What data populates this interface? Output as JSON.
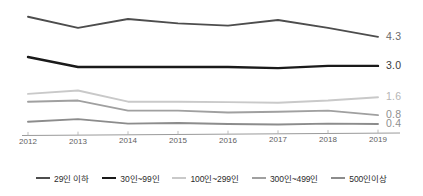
{
  "chart_data": {
    "type": "line",
    "title": "",
    "subtitle": "",
    "xlabel": "",
    "ylabel": "",
    "x": [
      "2012",
      "2013",
      "2014",
      "2015",
      "2016",
      "2017",
      "2018",
      "2019"
    ],
    "categories": [
      "2012",
      "2013",
      "2014",
      "2015",
      "2016",
      "2017",
      "2018",
      "2019"
    ],
    "xlim": [
      2012,
      2019
    ],
    "ylim": [
      0,
      5.5
    ],
    "grid": false,
    "legend_position": "bottom",
    "series": [
      {
        "name": "29인 이하",
        "color": "#4d4d4d",
        "width": 1.9,
        "values": [
          5.2,
          4.7,
          5.1,
          4.9,
          4.8,
          5.05,
          4.7,
          4.3
        ],
        "end_label": "4.3"
      },
      {
        "name": "30인~99인",
        "color": "#1a1a1a",
        "width": 2.4,
        "values": [
          3.4,
          2.95,
          2.95,
          2.95,
          2.95,
          2.9,
          3.0,
          3.0
        ],
        "end_label": "3.0"
      },
      {
        "name": "100인~299인",
        "color": "#c9c9c9",
        "width": 1.9,
        "values": [
          1.75,
          1.9,
          1.4,
          1.4,
          1.38,
          1.35,
          1.45,
          1.6
        ],
        "end_label": "1.6"
      },
      {
        "name": "300인~499인",
        "color": "#a0a0a0",
        "width": 1.9,
        "values": [
          1.4,
          1.45,
          1.0,
          1.0,
          0.92,
          0.95,
          1.0,
          0.8
        ],
        "end_label": "0.8"
      },
      {
        "name": "500인이상",
        "color": "#8c8c8c",
        "width": 1.9,
        "values": [
          0.5,
          0.62,
          0.42,
          0.45,
          0.4,
          0.38,
          0.42,
          0.4
        ],
        "end_label": "0.4"
      }
    ],
    "value_labels": [
      {
        "text": "4.3",
        "color": "#6a6a6a"
      },
      {
        "text": "3.0",
        "color": "#3a3a3a"
      },
      {
        "text": "1.6",
        "color": "#b5b5b5"
      },
      {
        "text": "0.8",
        "color": "#8f8f8f"
      },
      {
        "text": "0.4",
        "color": "#8f8f8f"
      }
    ]
  },
  "axis": {
    "line_color": "#9a9a9a",
    "tick_color": "#b5b5b5",
    "tick_labels": [
      "2012",
      "2013",
      "2014",
      "2015",
      "2016",
      "2017",
      "2018",
      "2019"
    ]
  },
  "legend": {
    "items": [
      {
        "label": "29인 이하",
        "color": "#4d4d4d",
        "width": "2px"
      },
      {
        "label": "30인~99인",
        "color": "#1a1a1a",
        "width": "2.6px"
      },
      {
        "label": "100인~299인",
        "color": "#c9c9c9",
        "width": "2px"
      },
      {
        "label": "300인~499인",
        "color": "#a0a0a0",
        "width": "2px"
      },
      {
        "label": "500인이상",
        "color": "#8c8c8c",
        "width": "2px"
      }
    ]
  }
}
